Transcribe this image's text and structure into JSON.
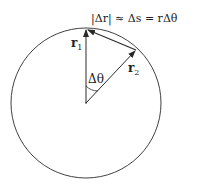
{
  "equation": "|Δr| ≈ Δs = rΔθ",
  "labels": {
    "r1": "r",
    "r1_sub": "1",
    "r2": "r",
    "r2_sub": "2",
    "angle": "Δθ"
  },
  "colors": {
    "line": "#2a2a2a",
    "background": "#ffffff"
  }
}
